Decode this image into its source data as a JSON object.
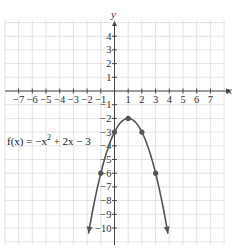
{
  "chart_data": {
    "type": "line",
    "title": "",
    "xlabel": "x",
    "ylabel": "y",
    "xlim": [
      -8,
      8
    ],
    "ylim": [
      -11,
      5
    ],
    "grid": true,
    "x_ticks": [
      "-7",
      "-6",
      "-5",
      "-4",
      "-3",
      "-2",
      "-1",
      "1",
      "2",
      "3",
      "4",
      "5",
      "6",
      "7"
    ],
    "y_ticks": [
      "4",
      "3",
      "2",
      "1",
      "-1",
      "-2",
      "-3",
      "-4",
      "-5",
      "-6",
      "-7",
      "-8",
      "-9",
      "-10"
    ],
    "function_label": "f(x) = -x² + 2x - 3",
    "function_label_parts": {
      "pre": "f(x) = −x",
      "sup": "2",
      "post": " + 2x − 3"
    },
    "series": [
      {
        "name": "f(x) = -x^2 + 2x - 3",
        "expression": "-x^2+2x-3",
        "domain": [
          -1.9,
          3.9
        ],
        "arrows_both_ends": true,
        "color": "#555555"
      }
    ],
    "points": [
      {
        "x": -1,
        "y": -6
      },
      {
        "x": 0,
        "y": -3
      },
      {
        "x": 1,
        "y": -2
      },
      {
        "x": 2,
        "y": -3
      },
      {
        "x": 3,
        "y": -6
      }
    ]
  }
}
